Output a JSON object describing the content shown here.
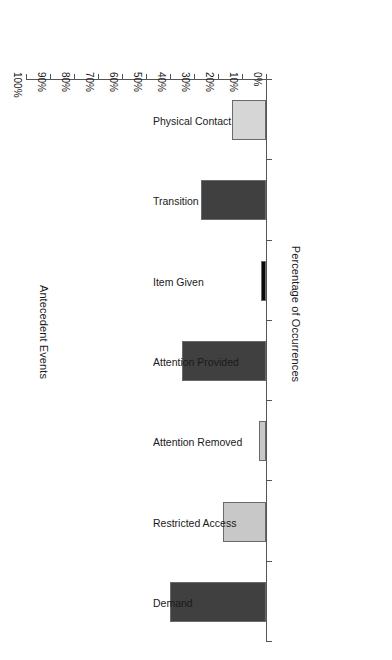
{
  "chart_data": {
    "type": "bar",
    "orientation": "horizontal",
    "rotated_180": true,
    "title": "",
    "xlabel": "Percentage of Occurrences",
    "ylabel": "Antecedent Events",
    "xlim": [
      0,
      100
    ],
    "grid": false,
    "legend": "none",
    "categories": [
      "Demand",
      "Restricted Access",
      "Attention Removed",
      "Attention Provided",
      "Item Given",
      "Transition",
      "Physical Contact"
    ],
    "values": [
      40,
      18,
      3,
      35,
      2,
      27,
      14
    ],
    "value_unit": "%",
    "tick_labels": [
      "0%",
      "10%",
      "20%",
      "30%",
      "40%",
      "50%",
      "60%",
      "70%",
      "80%",
      "90%",
      "100%"
    ],
    "tick_values": [
      0,
      10,
      20,
      30,
      40,
      50,
      60,
      70,
      80,
      90,
      100
    ],
    "bar_colors": [
      "#404040",
      "#c8c8c8",
      "#c8c8c8",
      "#404040",
      "#0a0a0a",
      "#404040",
      "#d6d6d6"
    ],
    "bar_border_color": "#6a6a6a",
    "axis_color": "#555555",
    "background": "#ffffff"
  },
  "axes": {
    "value_axis_title": "Percentage of Occurrences",
    "category_axis_title": "Antecedent Events"
  }
}
